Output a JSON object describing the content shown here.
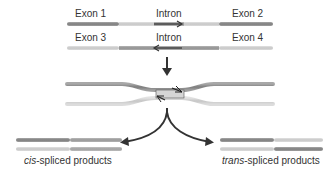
{
  "colors": {
    "dark_strand": "#8a8a8a",
    "light_strand": "#cfcfcf",
    "arrow": "#333333",
    "text": "#333333"
  },
  "top_pair": {
    "strand1": {
      "left_label": "Exon 1",
      "middle_label": "Intron",
      "right_label": "Exon 2",
      "intron_arrow": "right"
    },
    "strand2": {
      "left_label": "Exon 3",
      "middle_label": "Intron",
      "right_label": "Exon 4",
      "intron_arrow": "left"
    }
  },
  "middle": {
    "description": "paired introns forming crossover intermediate"
  },
  "products": {
    "cis": {
      "prefix": "cis",
      "suffix": "-spliced products"
    },
    "trans": {
      "prefix": "trans",
      "suffix": "-spliced products"
    }
  }
}
